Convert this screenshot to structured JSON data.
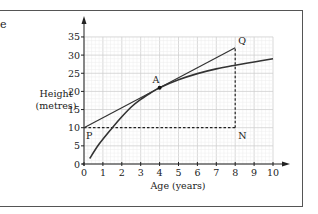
{
  "chart_data": {
    "type": "line",
    "title": "",
    "xlabel": "Age (years)",
    "ylabel": "Height (metres)",
    "ylabel_lines": [
      "Height",
      "(metres)"
    ],
    "xlim": [
      0,
      10
    ],
    "ylim": [
      0,
      35
    ],
    "x_ticks": [
      "0",
      "1",
      "2",
      "3",
      "4",
      "5",
      "6",
      "7",
      "8",
      "9",
      "10"
    ],
    "y_ticks": [
      "0",
      "5",
      "10",
      "15",
      "20",
      "25",
      "30",
      "35"
    ],
    "grid": true,
    "series": [
      {
        "name": "growth curve",
        "x": [
          0.3,
          0.8,
          1.5,
          2.0,
          2.5,
          3.0,
          3.5,
          4.0,
          5.0,
          6.0,
          7.0,
          8.0,
          9.0,
          10.0
        ],
        "y": [
          1.5,
          5.5,
          10.0,
          13.0,
          15.7,
          17.8,
          19.5,
          21.0,
          23.2,
          24.9,
          26.2,
          27.2,
          28.1,
          29.0
        ]
      },
      {
        "name": "tangent at A",
        "x": [
          0,
          8
        ],
        "y": [
          10,
          32
        ]
      }
    ],
    "dashed_lines": [
      {
        "from": [
          0,
          10
        ],
        "to": [
          8,
          10
        ]
      },
      {
        "from": [
          8,
          10
        ],
        "to": [
          8,
          32
        ]
      }
    ],
    "points": [
      {
        "label": "A",
        "x": 4,
        "y": 21,
        "marker": true
      },
      {
        "label": "P",
        "x": 0,
        "y": 10
      },
      {
        "label": "Q",
        "x": 8,
        "y": 32
      },
      {
        "label": "N",
        "x": 8,
        "y": 10
      }
    ]
  },
  "page": {
    "corner_text": "e"
  }
}
